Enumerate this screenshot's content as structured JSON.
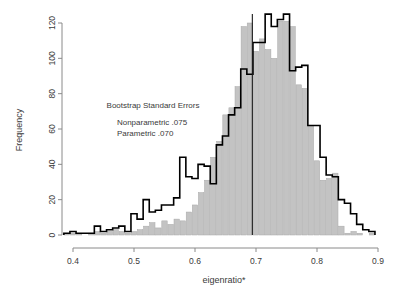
{
  "chart_data": {
    "type": "bar",
    "title": "",
    "subtitle": "",
    "xlabel": "eigenratio*",
    "ylabel": "Frequency",
    "xlim": [
      0.385,
      0.905
    ],
    "ylim": [
      0,
      127
    ],
    "xticks": [
      "0.4",
      "0.5",
      "0.6",
      "0.7",
      "0.8",
      "0.9"
    ],
    "xtick_values": [
      0.4,
      0.5,
      0.6,
      0.7,
      0.8,
      0.9
    ],
    "yticks": [
      "0",
      "20",
      "40",
      "60",
      "80",
      "100",
      "120"
    ],
    "ytick_values": [
      0,
      20,
      40,
      60,
      80,
      100,
      120
    ],
    "grid": false,
    "legend_position": "none",
    "bin_width": 0.01,
    "bin_starts": [
      0.385,
      0.395,
      0.405,
      0.415,
      0.425,
      0.435,
      0.445,
      0.455,
      0.465,
      0.475,
      0.485,
      0.495,
      0.505,
      0.515,
      0.525,
      0.535,
      0.545,
      0.555,
      0.565,
      0.575,
      0.585,
      0.595,
      0.605,
      0.615,
      0.625,
      0.635,
      0.645,
      0.655,
      0.665,
      0.675,
      0.685,
      0.695,
      0.705,
      0.715,
      0.725,
      0.735,
      0.745,
      0.755,
      0.765,
      0.775,
      0.785,
      0.795,
      0.805,
      0.815,
      0.825,
      0.835,
      0.845,
      0.855,
      0.865,
      0.875,
      0.885
    ],
    "series": [
      {
        "name": "Parametric",
        "style": "filled-bars",
        "color": "#c3c3c3",
        "edge": "#a8a8a8",
        "values": [
          1,
          1,
          1,
          0,
          1,
          2,
          1,
          2,
          3,
          2,
          1,
          2,
          3,
          5,
          7,
          4,
          8,
          6,
          9,
          8,
          13,
          17,
          24,
          31,
          44,
          53,
          68,
          72,
          84,
          118,
          120,
          104,
          111,
          105,
          100,
          121,
          121,
          118,
          85,
          83,
          62,
          42,
          31,
          32,
          35,
          5,
          1,
          2,
          1,
          0,
          1
        ]
      },
      {
        "name": "Nonparametric",
        "style": "step-outline",
        "color": "#000000",
        "values": [
          1,
          2,
          1,
          1,
          1,
          5,
          2,
          3,
          4,
          5,
          2,
          12,
          9,
          20,
          13,
          14,
          17,
          17,
          21,
          44,
          33,
          32,
          40,
          39,
          29,
          51,
          56,
          68,
          72,
          94,
          91,
          109,
          109,
          125,
          118,
          122,
          125,
          93,
          95,
          96,
          62,
          62,
          44,
          34,
          33,
          20,
          18,
          12,
          6,
          3,
          2
        ]
      }
    ],
    "annotations": [
      {
        "text": "Bootstrap Standard Errors",
        "x": 0.455,
        "y": 72
      },
      {
        "text": "Nonparametric .075",
        "x": 0.472,
        "y": 62
      },
      {
        "text": "Parametric .070",
        "x": 0.472,
        "y": 56
      }
    ],
    "reference_line": {
      "orientation": "vertical",
      "x": 0.694,
      "color": "#1a1a1a"
    }
  },
  "axes": {
    "x_title": "eigenratio*",
    "y_title": "Frequency"
  }
}
